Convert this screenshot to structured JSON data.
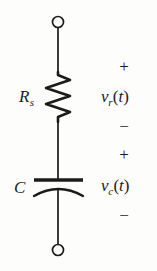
{
  "figure": {
    "type": "circuit-schematic",
    "background_color": "#fdfdfc",
    "ink_color": "#1b1b1b"
  },
  "circuit": {
    "orientation": "vertical",
    "terminals": [
      {
        "id": "top-terminal",
        "shape": "open-circle",
        "x": 58,
        "y": 22,
        "radius": 5.5
      },
      {
        "id": "bottom-terminal",
        "shape": "open-circle",
        "x": 58,
        "y": 250,
        "radius": 5.5
      }
    ],
    "components": [
      {
        "id": "resistor",
        "symbol": "zigzag",
        "designator": "R",
        "designator_subscript": "s",
        "peaks": 6,
        "x": 58,
        "y_top": 72,
        "y_bottom": 122
      },
      {
        "id": "capacitor",
        "symbol": "curved-plate",
        "designator": "C",
        "designator_subscript": "",
        "x": 58,
        "y_top_plate": 180,
        "y_bottom_plate": 190
      }
    ],
    "wire_x": 58
  },
  "annotations": {
    "resistor_voltage": {
      "plus": "+",
      "minus": "−",
      "symbol": "v",
      "subscript": "r",
      "argument": "(t)"
    },
    "capacitor_voltage": {
      "plus": "+",
      "minus": "−",
      "symbol": "v",
      "subscript": "c",
      "argument": "(t)"
    }
  },
  "labels": {
    "resistor_designator": "R",
    "resistor_subscript": "s",
    "capacitor_designator": "C"
  }
}
